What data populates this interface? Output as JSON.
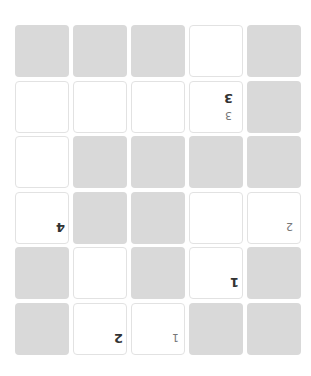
{
  "board": {
    "rows": 6,
    "cols": 5,
    "orientation": "rotated-180",
    "colors": {
      "shaded": "#d9d9d9",
      "open": "#ffffff",
      "border": "#e2e2e2"
    },
    "cells": [
      [
        {
          "s": "shaded"
        },
        {
          "s": "shaded"
        },
        {
          "s": "shaded"
        },
        {
          "s": "open"
        },
        {
          "s": "shaded"
        }
      ],
      [
        {
          "s": "open"
        },
        {
          "s": "open"
        },
        {
          "s": "open"
        },
        {
          "s": "open",
          "main": "3",
          "sub": "3"
        },
        {
          "s": "shaded"
        }
      ],
      [
        {
          "s": "open"
        },
        {
          "s": "shaded"
        },
        {
          "s": "shaded"
        },
        {
          "s": "shaded"
        },
        {
          "s": "shaded"
        }
      ],
      [
        {
          "s": "open",
          "main": "4"
        },
        {
          "s": "shaded"
        },
        {
          "s": "shaded"
        },
        {
          "s": "open"
        },
        {
          "s": "open",
          "sub": "2"
        }
      ],
      [
        {
          "s": "shaded"
        },
        {
          "s": "open"
        },
        {
          "s": "shaded"
        },
        {
          "s": "open",
          "main": "1"
        },
        {
          "s": "shaded"
        }
      ],
      [
        {
          "s": "shaded"
        },
        {
          "s": "open",
          "main": "2"
        },
        {
          "s": "open",
          "sub": "1"
        },
        {
          "s": "shaded"
        },
        {
          "s": "shaded"
        }
      ]
    ]
  }
}
